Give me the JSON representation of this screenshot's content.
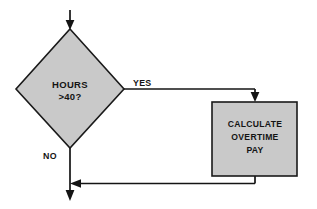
{
  "diagram": {
    "background_color": "#ffffff",
    "shape_fill_color": "#c9c9c9",
    "shape_stroke_color": "#1a1a1a",
    "line_color": "#141414"
  },
  "nodes": {
    "decision": {
      "type": "diamond",
      "name": "hours-decision",
      "line1": "HOURS",
      "line2": ">40?",
      "center_x": 70,
      "center_y": 89,
      "half_width": 54,
      "half_height": 60
    },
    "process": {
      "type": "rectangle",
      "name": "calculate-overtime-pay",
      "line1": "CALCULATE",
      "line2": "OVERTIME",
      "line3": "PAY",
      "x": 212,
      "y": 102,
      "width": 85,
      "height": 74
    }
  },
  "edges": {
    "entry": {
      "name": "entry-arrow",
      "label": ""
    },
    "yes_branch": {
      "name": "yes-branch",
      "label": "YES",
      "label_x": 133,
      "label_y": 84
    },
    "no_branch": {
      "name": "no-branch",
      "label": "NO",
      "label_x": 43,
      "label_y": 156
    },
    "merge": {
      "name": "merge-edge",
      "label": ""
    },
    "exit": {
      "name": "exit-arrow",
      "label": ""
    }
  }
}
